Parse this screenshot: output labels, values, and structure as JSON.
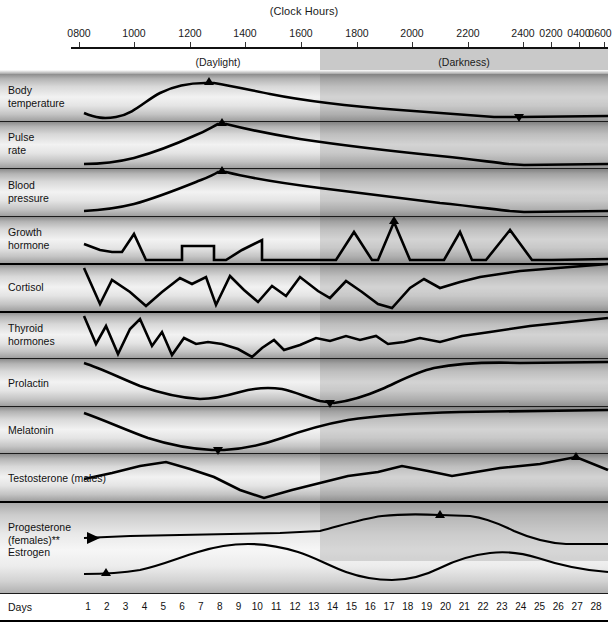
{
  "header": {
    "clock_title": "(Clock Hours)",
    "daylight_label": "(Daylight)",
    "darkness_label": "(Darkness)",
    "tick_labels": [
      "0800",
      "1000",
      "1200",
      "1400",
      "1600",
      "1800",
      "2000",
      "2200",
      "2400",
      "0200",
      "0400",
      "0600"
    ],
    "tick_x": [
      79,
      134,
      190,
      245,
      301,
      357,
      412,
      468,
      523,
      551,
      579,
      607
    ]
  },
  "axis": {
    "days_label": "Days",
    "day_numbers": [
      "1",
      "2",
      "3",
      "4",
      "5",
      "6",
      "7",
      "8",
      "9",
      "10",
      "11",
      "12",
      "13",
      "14",
      "15",
      "16",
      "17",
      "18",
      "19",
      "20",
      "21",
      "22",
      "23",
      "24",
      "25",
      "26",
      "27",
      "28"
    ]
  },
  "rows": [
    {
      "label_line1": "Body",
      "label_line2": "temperature"
    },
    {
      "label_line1": "Pulse",
      "label_line2": "rate"
    },
    {
      "label_line1": "Blood",
      "label_line2": "pressure"
    },
    {
      "label_line1": "Growth",
      "label_line2": "hormone"
    },
    {
      "label_line1": "Cortisol",
      "label_line2": ""
    },
    {
      "label_line1": "Thyroid",
      "label_line2": "hormones"
    },
    {
      "label_line1": "Prolactin",
      "label_line2": ""
    },
    {
      "label_line1": "Melatonin",
      "label_line2": ""
    },
    {
      "label_line1": "Testosterone (males)",
      "label_line2": ""
    },
    {
      "label_line1": "Progesterone",
      "label_line2": "(females)**",
      "label_line3": "Estrogen"
    }
  ],
  "chart_data": {
    "type": "line",
    "title": "(Clock Hours)",
    "xlabel": "Clock Hours / Days",
    "ylabel": "",
    "grid": false,
    "legend": "none",
    "x_ticks": [
      "0800",
      "1000",
      "1200",
      "1400",
      "1600",
      "1800",
      "2000",
      "2200",
      "2400",
      "0200",
      "0400",
      "0600"
    ],
    "day_ticks": [
      1,
      2,
      3,
      4,
      5,
      6,
      7,
      8,
      9,
      10,
      11,
      12,
      13,
      14,
      15,
      16,
      17,
      18,
      19,
      20,
      21,
      22,
      23,
      24,
      25,
      26,
      27,
      28
    ],
    "shaded_region": {
      "label": "(Darkness)",
      "start_clock": "1900",
      "end_clock": "0700"
    },
    "unshaded_region": {
      "label": "(Daylight)",
      "start_clock": "0800",
      "end_clock": "1900"
    },
    "series": [
      {
        "name": "Body temperature",
        "peak_clock": "1600",
        "trough_clock": "0400",
        "values_norm": [
          0.18,
          0.1,
          0.09,
          0.14,
          0.34,
          0.62,
          0.82,
          0.93,
          0.96,
          0.93,
          0.88,
          0.8,
          0.72,
          0.63,
          0.54,
          0.45,
          0.36,
          0.27,
          0.18,
          0.12,
          0.11,
          0.11
        ]
      },
      {
        "name": "Pulse rate",
        "peak_clock": "1600",
        "trough_clock": "0400",
        "values_norm": [
          0.1,
          0.11,
          0.13,
          0.18,
          0.29,
          0.47,
          0.68,
          0.86,
          0.96,
          0.9,
          0.84,
          0.78,
          0.72,
          0.66,
          0.59,
          0.51,
          0.42,
          0.32,
          0.2,
          0.11,
          0.1,
          0.1
        ]
      },
      {
        "name": "Blood pressure",
        "peak_clock": "1600",
        "trough_clock": "0400",
        "values_norm": [
          0.09,
          0.11,
          0.15,
          0.22,
          0.32,
          0.5,
          0.72,
          0.9,
          0.97,
          0.88,
          0.8,
          0.74,
          0.68,
          0.62,
          0.56,
          0.5,
          0.42,
          0.3,
          0.16,
          0.1,
          0.1,
          0.1
        ]
      },
      {
        "name": "Growth hormone",
        "peak_clock": "2200",
        "pattern": "pulsatile",
        "values_norm": [
          0.42,
          0.32,
          0.22,
          0.2,
          0.58,
          0.22,
          0.2,
          0.44,
          0.44,
          0.44,
          0.2,
          0.3,
          0.44,
          0.62,
          0.12,
          0.12,
          0.12,
          0.74,
          0.12,
          1.0,
          0.14,
          0.14,
          0.7,
          0.12,
          0.74,
          0.18,
          0.16,
          0.16
        ]
      },
      {
        "name": "Cortisol",
        "peak_clock": "0800",
        "pattern": "declining-zigzag",
        "values_norm": [
          1.0,
          0.3,
          0.62,
          0.4,
          0.12,
          0.4,
          0.66,
          0.58,
          0.66,
          0.18,
          0.62,
          0.42,
          0.22,
          0.46,
          0.34,
          0.66,
          0.42,
          0.3,
          0.56,
          0.4,
          0.22,
          0.08,
          0.42,
          0.6,
          0.46,
          0.62,
          0.82,
          0.92
        ]
      },
      {
        "name": "Thyroid hormones",
        "peak_clock": "0800",
        "pattern": "declining-zigzag",
        "values_norm": [
          0.96,
          0.44,
          0.78,
          0.12,
          0.66,
          0.86,
          0.34,
          0.58,
          0.12,
          0.48,
          0.38,
          0.42,
          0.38,
          0.3,
          0.02,
          0.2,
          0.34,
          0.16,
          0.3,
          0.46,
          0.4,
          0.3,
          0.48,
          0.42,
          0.34,
          0.5,
          0.4,
          0.58,
          0.72
        ]
      },
      {
        "name": "Prolactin",
        "trough_clock": "1900",
        "peak_clock": "0400",
        "values_norm": [
          0.96,
          0.8,
          0.62,
          0.46,
          0.34,
          0.28,
          0.3,
          0.34,
          0.36,
          0.33,
          0.24,
          0.12,
          0.08,
          0.1,
          0.16,
          0.26,
          0.42,
          0.62,
          0.8,
          0.9,
          0.94,
          0.96
        ]
      },
      {
        "name": "Melatonin",
        "trough_clock": "1300",
        "peak_clock": "0400",
        "values_norm": [
          0.9,
          0.66,
          0.44,
          0.26,
          0.14,
          0.08,
          0.08,
          0.12,
          0.22,
          0.38,
          0.52,
          0.6,
          0.66,
          0.72,
          0.78,
          0.82,
          0.86,
          0.9,
          0.93,
          0.95,
          0.96,
          0.97
        ]
      },
      {
        "name": "Testosterone (males)",
        "trough_clock": "1800",
        "peak_clock": "0600",
        "values_norm": [
          0.6,
          0.66,
          0.74,
          0.8,
          0.74,
          0.62,
          0.54,
          0.34,
          0.1,
          0.02,
          0.22,
          0.38,
          0.5,
          0.58,
          0.6,
          0.7,
          0.64,
          0.58,
          0.56,
          0.68,
          0.82,
          0.92,
          0.7
        ]
      },
      {
        "name": "Progesterone (females)**",
        "peak_day": 21,
        "cycle_days": 28,
        "values_norm": [
          0.4,
          0.4,
          0.4,
          0.4,
          0.4,
          0.4,
          0.4,
          0.4,
          0.4,
          0.4,
          0.4,
          0.4,
          0.4,
          0.42,
          0.52,
          0.68,
          0.8,
          0.88,
          0.93,
          0.96,
          0.97,
          0.96,
          0.92,
          0.82,
          0.66,
          0.52,
          0.44,
          0.4
        ]
      },
      {
        "name": "Estrogen",
        "peak_days": [
          13,
          22
        ],
        "cycle_days": 28,
        "values_norm": [
          0.18,
          0.18,
          0.2,
          0.26,
          0.4,
          0.58,
          0.72,
          0.8,
          0.82,
          0.8,
          0.74,
          0.7,
          0.74,
          0.62,
          0.4,
          0.24,
          0.18,
          0.22,
          0.38,
          0.56,
          0.64,
          0.66,
          0.62,
          0.48,
          0.3,
          0.2,
          0.18,
          0.18
        ]
      }
    ]
  }
}
